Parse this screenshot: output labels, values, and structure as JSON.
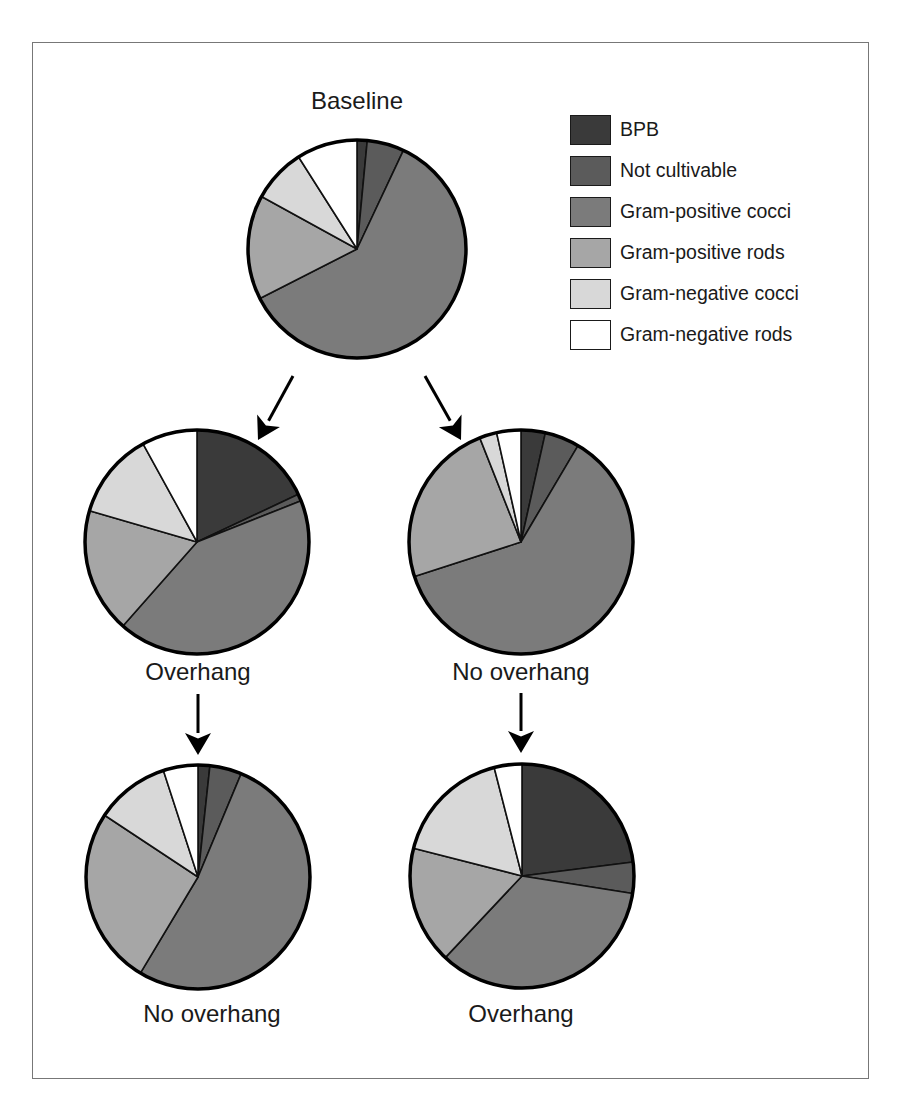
{
  "figure": {
    "legend": [
      {
        "key": "bpb",
        "label": "BPB",
        "color": "#3a3a3a"
      },
      {
        "key": "nc",
        "label": "Not cultivable",
        "color": "#5b5b5b"
      },
      {
        "key": "gpc",
        "label": "Gram-positive cocci",
        "color": "#7b7b7b"
      },
      {
        "key": "gpr",
        "label": "Gram-positive rods",
        "color": "#a6a6a6"
      },
      {
        "key": "gnc",
        "label": "Gram-negative cocci",
        "color": "#d8d8d8"
      },
      {
        "key": "gnr",
        "label": "Gram-negative rods",
        "color": "#ffffff"
      }
    ],
    "pies": [
      {
        "id": "baseline",
        "label": "Baseline",
        "cx": 357,
        "cy": 249,
        "r": 109,
        "label_x": 357,
        "label_y": 87
      },
      {
        "id": "mid-left",
        "label": "Overhang",
        "cx": 197,
        "cy": 542,
        "r": 112,
        "label_x": 198,
        "label_y": 658
      },
      {
        "id": "mid-right",
        "label": "No overhang",
        "cx": 521,
        "cy": 542,
        "r": 112,
        "label_x": 521,
        "label_y": 658
      },
      {
        "id": "bottom-left",
        "label": "No overhang",
        "cx": 198,
        "cy": 877,
        "r": 112,
        "label_x": 212,
        "label_y": 1000
      },
      {
        "id": "bottom-right",
        "label": "Overhang",
        "cx": 522,
        "cy": 876,
        "r": 112,
        "label_x": 521,
        "label_y": 1000
      }
    ],
    "arrows": [
      {
        "x1": 293,
        "y1": 376,
        "x2": 258,
        "y2": 440
      },
      {
        "x1": 425,
        "y1": 376,
        "x2": 461,
        "y2": 440
      },
      {
        "x1": 198,
        "y1": 694,
        "x2": 198,
        "y2": 755
      },
      {
        "x1": 521,
        "y1": 693,
        "x2": 521,
        "y2": 753
      }
    ]
  },
  "chart_data": {
    "type": "pie",
    "title": "",
    "units": "percent of isolates (estimated from slice angles)",
    "categories": [
      "BPB",
      "Not cultivable",
      "Gram-positive cocci",
      "Gram-positive rods",
      "Gram-negative cocci",
      "Gram-negative rods"
    ],
    "legend_position": "top-right",
    "pies": [
      {
        "name": "Baseline",
        "position": "top-center",
        "values": [
          1.5,
          5.5,
          60.5,
          15.5,
          8.0,
          9.0
        ]
      },
      {
        "name": "Overhang",
        "position": "middle-left",
        "from": "Baseline",
        "values": [
          18.0,
          1.0,
          42.5,
          18.0,
          12.5,
          8.0
        ]
      },
      {
        "name": "No overhang",
        "position": "middle-right",
        "from": "Baseline",
        "values": [
          3.5,
          5.0,
          61.5,
          24.0,
          2.5,
          3.5
        ]
      },
      {
        "name": "No overhang",
        "position": "bottom-left",
        "from": "Overhang (middle-left)",
        "values": [
          1.7,
          4.6,
          52.3,
          25.7,
          10.7,
          5.0
        ]
      },
      {
        "name": "Overhang",
        "position": "bottom-right",
        "from": "No overhang (middle-right)",
        "values": [
          23.0,
          4.5,
          34.5,
          17.0,
          17.0,
          4.0
        ]
      }
    ],
    "annotations": [
      "Arrows: Baseline → Overhang, Baseline → No overhang, Overhang → No overhang, No overhang → Overhang"
    ]
  }
}
